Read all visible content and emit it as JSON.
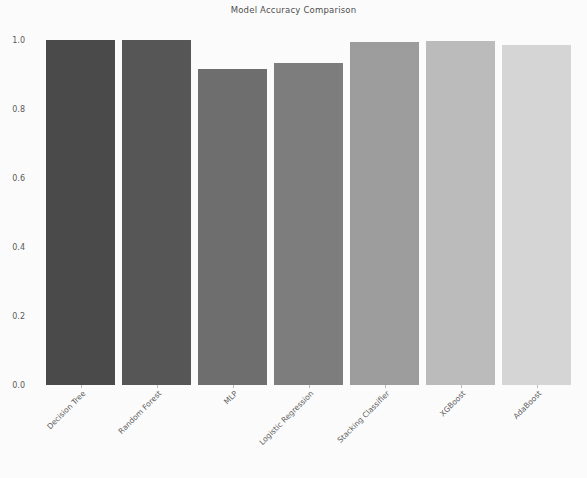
{
  "chart_data": {
    "type": "bar",
    "title": "Model Accuracy Comparison",
    "xlabel": "",
    "ylabel": "Accuracy",
    "categories": [
      "Decision Tree",
      "Random Forest",
      "MLP",
      "Logistic Regression",
      "Stacking Classifier",
      "XGBoost",
      "AdaBoost"
    ],
    "values": [
      1.0,
      1.0,
      0.916,
      0.933,
      0.995,
      0.997,
      0.985
    ],
    "ylim": [
      0.0,
      1.0
    ],
    "yticks": [
      "0.0",
      "0.2",
      "0.4",
      "0.6",
      "0.8",
      "1.0"
    ],
    "ytick_values": [
      0.0,
      0.2,
      0.4,
      0.6,
      0.8,
      1.0
    ],
    "grid": false,
    "legend": null,
    "bar_colors": [
      "#4a4a4a",
      "#565656",
      "#6e6e6e",
      "#7d7d7d",
      "#9d9d9d",
      "#bcbcbc",
      "#d6d6d6"
    ]
  }
}
